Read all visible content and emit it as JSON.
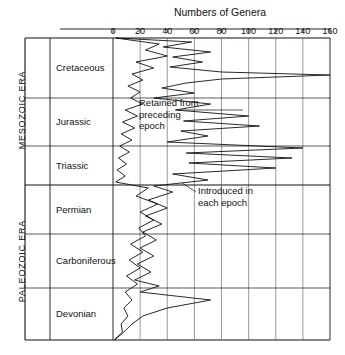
{
  "chart_title": "Numbers of Genera",
  "axis": {
    "xlabel": "Numbers of Genera",
    "xticks": [
      0,
      20,
      40,
      60,
      80,
      100,
      120,
      140,
      160
    ],
    "xlim": [
      0,
      160
    ],
    "orientation": "horizontal-axis-top, time-axis-vertical-downward"
  },
  "eras": [
    {
      "name": "MESOZOIC  ERA"
    },
    {
      "name": "PALEOZOIC  ERA"
    }
  ],
  "epochs": [
    {
      "label": "Cretaceous"
    },
    {
      "label": "Jurassic"
    },
    {
      "label": "Triassic"
    },
    {
      "label": "Permian"
    },
    {
      "label": "Carboniferous"
    },
    {
      "label": "Devonian"
    }
  ],
  "annotations": [
    {
      "text": "Retained from\npreceding\nepoch"
    },
    {
      "text": "Introduced in\neach epoch"
    }
  ],
  "colors": {
    "ink": "#111111",
    "grid": "#555555",
    "background": "#ffffff"
  },
  "chart_data": {
    "type": "line",
    "title": "Numbers of Genera",
    "xlabel": "Numbers of Genera",
    "ylabel": "Geologic time (Devonian at base to Cretaceous at top)",
    "xlim": [
      0,
      160
    ],
    "xticks": [
      0,
      20,
      40,
      60,
      80,
      100,
      120,
      140,
      160
    ],
    "grid": true,
    "legend_position": "inline-annotations",
    "orientation": "vertical-time-axis",
    "series": [
      {
        "name": "Introduced in each epoch",
        "points": [
          {
            "t": 38,
            "value": 2
          },
          {
            "t": 44,
            "value": 34
          },
          {
            "t": 50,
            "value": 24
          },
          {
            "t": 56,
            "value": 40
          },
          {
            "t": 62,
            "value": 17
          },
          {
            "t": 68,
            "value": 30
          },
          {
            "t": 74,
            "value": 14
          },
          {
            "t": 80,
            "value": 22
          },
          {
            "t": 86,
            "value": 11
          },
          {
            "t": 92,
            "value": 20
          },
          {
            "t": 98,
            "value": 13
          },
          {
            "t": 104,
            "value": 22
          },
          {
            "t": 110,
            "value": 9
          },
          {
            "t": 116,
            "value": 18
          },
          {
            "t": 122,
            "value": 7
          },
          {
            "t": 128,
            "value": 16
          },
          {
            "t": 134,
            "value": 6
          },
          {
            "t": 140,
            "value": 14
          },
          {
            "t": 146,
            "value": 5
          },
          {
            "t": 152,
            "value": 12
          },
          {
            "t": 158,
            "value": 4
          },
          {
            "t": 164,
            "value": 10
          },
          {
            "t": 170,
            "value": 3
          },
          {
            "t": 176,
            "value": 9
          },
          {
            "t": 182,
            "value": 2
          },
          {
            "t": 188,
            "value": 26
          },
          {
            "t": 196,
            "value": 17
          },
          {
            "t": 204,
            "value": 33
          },
          {
            "t": 212,
            "value": 20
          },
          {
            "t": 220,
            "value": 30
          },
          {
            "t": 228,
            "value": 19
          },
          {
            "t": 236,
            "value": 24
          },
          {
            "t": 244,
            "value": 13
          },
          {
            "t": 252,
            "value": 22
          },
          {
            "t": 260,
            "value": 12
          },
          {
            "t": 268,
            "value": 20
          },
          {
            "t": 276,
            "value": 10
          },
          {
            "t": 284,
            "value": 18
          },
          {
            "t": 292,
            "value": 9
          },
          {
            "t": 300,
            "value": 14
          },
          {
            "t": 308,
            "value": 8
          },
          {
            "t": 316,
            "value": 11
          },
          {
            "t": 324,
            "value": 6
          },
          {
            "t": 332,
            "value": 7
          },
          {
            "t": 340,
            "value": 1
          }
        ]
      },
      {
        "name": "Retained from preceding epoch",
        "points": [
          {
            "t": 38,
            "value": 2
          },
          {
            "t": 42,
            "value": 58
          },
          {
            "t": 47,
            "value": 37
          },
          {
            "t": 52,
            "value": 72
          },
          {
            "t": 57,
            "value": 44
          },
          {
            "t": 62,
            "value": 66
          },
          {
            "t": 67,
            "value": 42
          },
          {
            "t": 72,
            "value": 80
          },
          {
            "t": 75,
            "value": 160
          },
          {
            "t": 79,
            "value": 80
          },
          {
            "t": 83,
            "value": 54
          },
          {
            "t": 88,
            "value": 36
          },
          {
            "t": 93,
            "value": 60
          },
          {
            "t": 98,
            "value": 30
          },
          {
            "t": 104,
            "value": 72
          },
          {
            "t": 110,
            "value": 46
          },
          {
            "t": 116,
            "value": 100
          },
          {
            "t": 121,
            "value": 52
          },
          {
            "t": 126,
            "value": 108
          },
          {
            "t": 131,
            "value": 50
          },
          {
            "t": 136,
            "value": 70
          },
          {
            "t": 142,
            "value": 40
          },
          {
            "t": 148,
            "value": 140
          },
          {
            "t": 153,
            "value": 54
          },
          {
            "t": 158,
            "value": 132
          },
          {
            "t": 163,
            "value": 56
          },
          {
            "t": 168,
            "value": 120
          },
          {
            "t": 174,
            "value": 44
          },
          {
            "t": 180,
            "value": 70
          },
          {
            "t": 186,
            "value": 30
          },
          {
            "t": 192,
            "value": 44
          },
          {
            "t": 200,
            "value": 26
          },
          {
            "t": 208,
            "value": 40
          },
          {
            "t": 216,
            "value": 24
          },
          {
            "t": 224,
            "value": 36
          },
          {
            "t": 232,
            "value": 22
          },
          {
            "t": 240,
            "value": 32
          },
          {
            "t": 248,
            "value": 20
          },
          {
            "t": 256,
            "value": 30
          },
          {
            "t": 264,
            "value": 18
          },
          {
            "t": 272,
            "value": 28
          },
          {
            "t": 280,
            "value": 16
          },
          {
            "t": 286,
            "value": 34
          },
          {
            "t": 292,
            "value": 20
          },
          {
            "t": 300,
            "value": 72
          },
          {
            "t": 308,
            "value": 40
          },
          {
            "t": 316,
            "value": 22
          },
          {
            "t": 324,
            "value": 14
          },
          {
            "t": 332,
            "value": 8
          },
          {
            "t": 340,
            "value": 1
          }
        ]
      }
    ]
  },
  "layout": {
    "plot_left_px": 113,
    "plot_right_px": 330,
    "plot_top_px": 38,
    "plot_bottom_px": 340,
    "era_col_left_px": 25,
    "epoch_col_left_px": 50,
    "epoch_dividers_px": [
      98,
      146,
      185,
      234,
      288
    ],
    "era_divider_px": 185
  }
}
